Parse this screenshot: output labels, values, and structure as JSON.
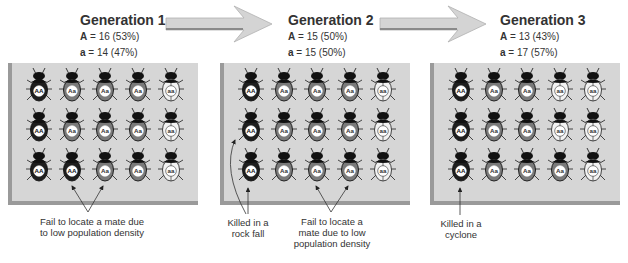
{
  "colors": {
    "AA": "#1e1e1e",
    "Aa": "#7a7a7a",
    "aa": "#f2f2f2",
    "panel_bg": "#d6d6d6",
    "panel_shadow": "#9a9a9a",
    "arrow_fill": "#d4d4d4"
  },
  "generations": [
    {
      "title": "Generation 1",
      "freq_A_label": "A",
      "freq_A_value": " = 16 (53%)",
      "freq_a_label": "a",
      "freq_a_value": " = 14 (47%)",
      "rows": [
        [
          "AA",
          "Aa",
          "Aa",
          "Aa",
          "aa"
        ],
        [
          "AA",
          "Aa",
          "Aa",
          "Aa",
          "aa"
        ],
        [
          "AA",
          "AA",
          "Aa",
          "Aa",
          "aa"
        ]
      ],
      "captions": [
        {
          "text_line1": "Fail to locate a mate due",
          "text_line2": "to low population density",
          "text_line3": ""
        }
      ]
    },
    {
      "title": "Generation 2",
      "freq_A_label": "A",
      "freq_A_value": " = 15 (50%)",
      "freq_a_label": "a",
      "freq_a_value": " = 15 (50%)",
      "rows": [
        [
          "AA",
          "Aa",
          "Aa",
          "Aa",
          "aa"
        ],
        [
          "AA",
          "Aa",
          "Aa",
          "Aa",
          "aa"
        ],
        [
          "AA",
          "Aa",
          "Aa",
          "Aa",
          "aa"
        ]
      ],
      "captions": [
        {
          "text_line1": "Killed in a",
          "text_line2": "rock fall",
          "text_line3": ""
        },
        {
          "text_line1": "Fail to locate a",
          "text_line2": "mate due to low",
          "text_line3": "population density"
        }
      ]
    },
    {
      "title": "Generation 3",
      "freq_A_label": "A",
      "freq_A_value": " = 13 (43%)",
      "freq_a_label": "a",
      "freq_a_value": " = 17 (57%)",
      "rows": [
        [
          "AA",
          "Aa",
          "Aa",
          "aa",
          "aa"
        ],
        [
          "AA",
          "Aa",
          "Aa",
          "aa",
          "aa"
        ],
        [
          "AA",
          "Aa",
          "Aa",
          "Aa",
          "aa"
        ]
      ],
      "captions": [
        {
          "text_line1": "Killed in a",
          "text_line2": "cyclone",
          "text_line3": ""
        }
      ]
    }
  ]
}
